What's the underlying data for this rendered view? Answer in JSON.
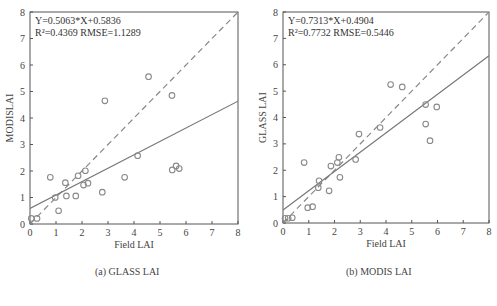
{
  "chart_data": [
    {
      "type": "scatter",
      "panel": "a",
      "caption": "(a)  GLASS LAI",
      "xlabel": "Field LAI",
      "ylabel": "MODISLAI",
      "xlim": [
        0,
        8
      ],
      "ylim": [
        0,
        8
      ],
      "xticks": [
        0,
        1,
        2,
        3,
        4,
        5,
        6,
        7,
        8
      ],
      "yticks": [
        0,
        1,
        2,
        3,
        4,
        5,
        6,
        7,
        8
      ],
      "grid": false,
      "annotation": {
        "equation": "Y=0.5063*X+0.5836",
        "stats": "R²=0.4369  RMSE=1.1289"
      },
      "fit": {
        "slope": 0.5063,
        "intercept": 0.5836
      },
      "one_to_one_line": true,
      "points": [
        {
          "x": 0.05,
          "y": 0.21
        },
        {
          "x": 0.27,
          "y": 0.21
        },
        {
          "x": 0.78,
          "y": 1.76
        },
        {
          "x": 0.97,
          "y": 1.0
        },
        {
          "x": 1.1,
          "y": 0.5
        },
        {
          "x": 1.36,
          "y": 1.56
        },
        {
          "x": 1.4,
          "y": 1.06
        },
        {
          "x": 1.76,
          "y": 1.06
        },
        {
          "x": 1.85,
          "y": 1.82
        },
        {
          "x": 2.06,
          "y": 1.47
        },
        {
          "x": 2.13,
          "y": 2.01
        },
        {
          "x": 2.23,
          "y": 1.54
        },
        {
          "x": 2.78,
          "y": 1.2
        },
        {
          "x": 2.88,
          "y": 4.65
        },
        {
          "x": 3.64,
          "y": 1.76
        },
        {
          "x": 4.14,
          "y": 2.58
        },
        {
          "x": 4.56,
          "y": 5.56
        },
        {
          "x": 5.46,
          "y": 4.85
        },
        {
          "x": 5.47,
          "y": 2.04
        },
        {
          "x": 5.62,
          "y": 2.19
        },
        {
          "x": 5.74,
          "y": 2.09
        }
      ]
    },
    {
      "type": "scatter",
      "panel": "b",
      "caption": "(b)  MODIS LAI",
      "xlabel": "Field LAI",
      "ylabel": "GLASS LAI",
      "xlim": [
        0,
        8
      ],
      "ylim": [
        0,
        8
      ],
      "xticks": [
        0,
        1,
        2,
        3,
        4,
        5,
        6,
        7,
        8
      ],
      "yticks": [
        0,
        1,
        2,
        3,
        4,
        5,
        6,
        7,
        8
      ],
      "grid": false,
      "annotation": {
        "equation": "Y=0.7313*X+0.4904",
        "stats": "R²=0.7732  RMSE=0.5446"
      },
      "fit": {
        "slope": 0.7313,
        "intercept": 0.4904
      },
      "one_to_one_line": true,
      "points": [
        {
          "x": 0.08,
          "y": 0.18
        },
        {
          "x": 0.2,
          "y": 0.18
        },
        {
          "x": 0.36,
          "y": 0.2
        },
        {
          "x": 0.82,
          "y": 2.29
        },
        {
          "x": 0.96,
          "y": 0.58
        },
        {
          "x": 1.15,
          "y": 0.62
        },
        {
          "x": 1.37,
          "y": 1.34
        },
        {
          "x": 1.4,
          "y": 1.6
        },
        {
          "x": 1.79,
          "y": 1.22
        },
        {
          "x": 1.86,
          "y": 2.16
        },
        {
          "x": 2.11,
          "y": 2.29
        },
        {
          "x": 2.17,
          "y": 2.49
        },
        {
          "x": 2.21,
          "y": 1.73
        },
        {
          "x": 2.82,
          "y": 2.41
        },
        {
          "x": 2.95,
          "y": 3.37
        },
        {
          "x": 3.77,
          "y": 3.62
        },
        {
          "x": 4.18,
          "y": 5.25
        },
        {
          "x": 4.63,
          "y": 5.16
        },
        {
          "x": 5.54,
          "y": 4.49
        },
        {
          "x": 5.54,
          "y": 3.75
        },
        {
          "x": 5.71,
          "y": 3.12
        },
        {
          "x": 5.97,
          "y": 4.4
        }
      ]
    }
  ],
  "style": {
    "axis_color": "#555555",
    "point_color": "#8a8a8a",
    "fit_line_color": "#777777",
    "dash_line_color": "#888888"
  }
}
